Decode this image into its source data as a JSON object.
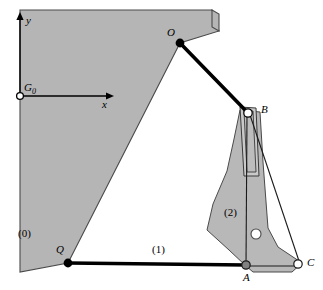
{
  "figure": {
    "type": "mechanism-diagram",
    "width": 323,
    "height": 290
  },
  "colors": {
    "body_fill": "#b5b5b5",
    "link2_fill": "#b8b8b8",
    "slot_fill": "#c9c9c9",
    "outline": "#4a4a4a",
    "line": "#000000",
    "background": "#ffffff",
    "joint_fixed": "#000000",
    "joint_open": "#ffffff",
    "joint_gray": "#808080"
  },
  "axes": {
    "origin_label": "G",
    "origin_subscript": "0",
    "x_label": "x",
    "y_label": "y",
    "origin_px": {
      "x": 20,
      "y": 96
    },
    "x_tip_px": {
      "x": 112,
      "y": 96
    },
    "y_tip_px": {
      "x": 20,
      "y": 14
    }
  },
  "bodies": [
    {
      "name": "ground",
      "label": "(0)",
      "label_px": {
        "x": 18,
        "y": 228
      }
    },
    {
      "name": "link-one",
      "label": "(1)",
      "label_px": {
        "x": 152,
        "y": 244
      }
    },
    {
      "name": "link-two",
      "label": "(2)",
      "label_px": {
        "x": 224,
        "y": 207
      }
    }
  ],
  "joints": [
    {
      "name": "O",
      "label": "O",
      "type": "fixed-pivot",
      "style": "filled",
      "px": {
        "x": 180,
        "y": 43
      },
      "label_px": {
        "x": 168,
        "y": 28
      }
    },
    {
      "name": "B",
      "label": "B",
      "type": "slider-pin",
      "style": "open",
      "px": {
        "x": 248,
        "y": 113
      },
      "label_px": {
        "x": 261,
        "y": 104
      }
    },
    {
      "name": "Q",
      "label": "Q",
      "type": "fixed-pivot",
      "style": "filled",
      "px": {
        "x": 68,
        "y": 263
      },
      "label_px": {
        "x": 57,
        "y": 245
      }
    },
    {
      "name": "A",
      "label": "A",
      "type": "pin",
      "style": "gray",
      "px": {
        "x": 246,
        "y": 265
      },
      "label_px": {
        "x": 243,
        "y": 272
      }
    },
    {
      "name": "C",
      "label": "C",
      "type": "pin",
      "style": "open",
      "px": {
        "x": 298,
        "y": 264
      },
      "label_px": {
        "x": 307,
        "y": 258
      }
    },
    {
      "name": "hole",
      "label": "",
      "type": "hole",
      "style": "open",
      "px": {
        "x": 256,
        "y": 234
      },
      "label_px": {
        "x": 0,
        "y": 0
      }
    }
  ],
  "geometry": {
    "ground_polygon": "20,10 212,10 219,31 180,43 68,263 20,272",
    "ground_notch": "212,10 219,31 219,14 212,10",
    "link1_bar": {
      "x1": 68,
      "y1": 263,
      "x2": 246,
      "y2": 265
    },
    "linkOB_bar": {
      "x1": 180,
      "y1": 43,
      "x2": 248,
      "y2": 113
    },
    "link2_polygon": "243,112 259,113 262,160 268,228 277,247 301,264 290,272 252,271 246,266 228,249 206,229 212,205 226,172 233,140",
    "slot_rect": "241,109 255,109 258,175 244,175",
    "slot_inner": "244,112 253,112 255,172 246,172",
    "thin_line_BA": {
      "x1": 247,
      "y1": 116,
      "x2": 246,
      "y2": 265
    },
    "thin_line_BC": {
      "x1": 249,
      "y1": 116,
      "x2": 300,
      "y2": 265
    },
    "thin_line_AC": {
      "x1": 246,
      "y1": 266,
      "x2": 300,
      "y2": 266
    }
  }
}
